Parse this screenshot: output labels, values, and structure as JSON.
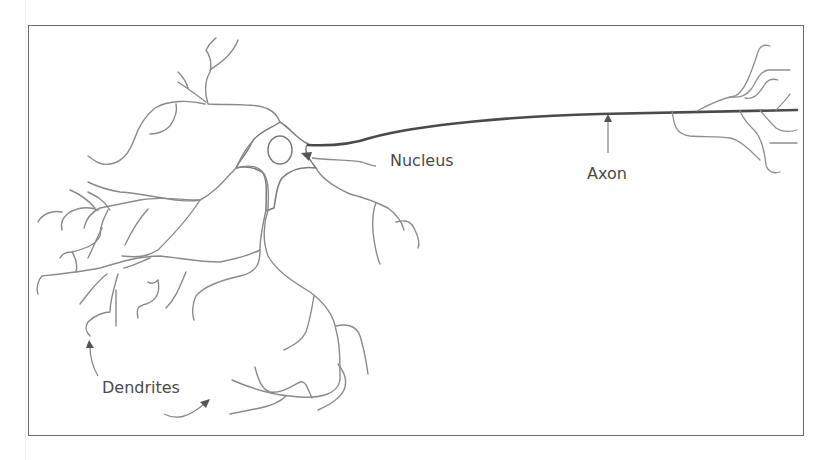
{
  "diagram": {
    "type": "labeled-illustration",
    "labels": {
      "nucleus": "Nucleus",
      "axon": "Axon",
      "dendrites": "Dendrites"
    },
    "colors": {
      "frame": "#6a6a6a",
      "dendrite_stroke": "#8a8a8a",
      "axon_stroke": "#4a4a4a",
      "label_text": "#4a4a4a",
      "background": "#ffffff"
    },
    "parts": [
      "cell-body",
      "nucleus",
      "dendrites",
      "axon",
      "axon-terminals"
    ],
    "arrows": [
      {
        "label": "Nucleus",
        "points_to": "nucleus"
      },
      {
        "label": "Axon",
        "points_to": "axon"
      },
      {
        "label": "Dendrites",
        "points_to": "dendrites",
        "count": 2
      }
    ]
  }
}
